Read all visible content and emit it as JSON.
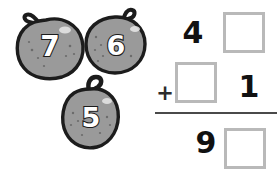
{
  "worksheet": {
    "title": "Apple addition worksheet",
    "background_color": "#ffffff"
  },
  "apples": {
    "fill_color": "#9a9a9a",
    "outline_color": "#1c1c1c",
    "digit_color": "#ffffff",
    "items": [
      {
        "name": "apple-seven",
        "label": "7"
      },
      {
        "name": "apple-six",
        "label": "6"
      },
      {
        "name": "apple-five",
        "label": "5"
      }
    ]
  },
  "sum": {
    "operator": "+",
    "rule_color": "#4a4a4a",
    "box_border_color": "#b9b9b9",
    "digit_color": "#111111",
    "rows": {
      "addend1": {
        "tens": "4",
        "ones": ""
      },
      "addend2": {
        "tens": "",
        "ones": "1"
      },
      "total": {
        "tens": "9",
        "ones": ""
      }
    }
  }
}
